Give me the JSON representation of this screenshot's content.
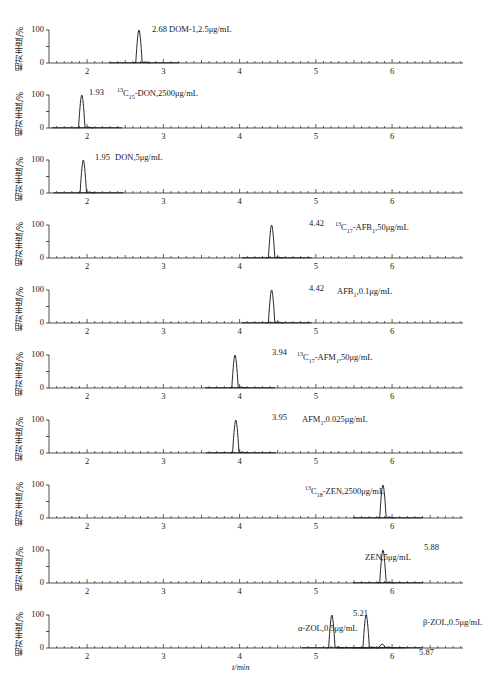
{
  "chart_data": {
    "type": "line",
    "title": "",
    "xlabel": "t/min",
    "ylabel": "相对丰度/%",
    "xlim": [
      1.5,
      6.9
    ],
    "ylim": [
      0,
      100
    ],
    "xticks": [
      "2",
      "3",
      "4",
      "5",
      "6"
    ],
    "yticks": [
      "0",
      "100"
    ],
    "panels": [
      {
        "label": "DOM-1,2.5μg/mL",
        "peaks": [
          {
            "rt": 2.68,
            "label": "2.68",
            "height": 100
          }
        ]
      },
      {
        "label": "13C15-DON,2500μg/mL",
        "peaks": [
          {
            "rt": 1.93,
            "label": "1.93",
            "height": 100
          }
        ]
      },
      {
        "label": "DON,5μg/mL",
        "peaks": [
          {
            "rt": 1.95,
            "label": "1.95",
            "height": 100
          }
        ]
      },
      {
        "label": "13C17-AFB1,50μg/mL",
        "peaks": [
          {
            "rt": 4.42,
            "label": "4.42",
            "height": 100
          }
        ]
      },
      {
        "label": "AFB1,0.1μg/mL",
        "peaks": [
          {
            "rt": 4.42,
            "label": "4.42",
            "height": 100
          }
        ]
      },
      {
        "label": "13C17-AFM1,50μg/mL",
        "peaks": [
          {
            "rt": 3.94,
            "label": "3.94",
            "height": 100
          }
        ]
      },
      {
        "label": "AFM1,0.025μg/mL",
        "peaks": [
          {
            "rt": 3.95,
            "label": "3.95",
            "height": 100
          }
        ]
      },
      {
        "label": "13C18-ZEN,2500μg/mL",
        "peaks": [
          {
            "rt": 5.88,
            "label": "",
            "height": 100
          }
        ]
      },
      {
        "label": "ZEN,5μg/mL",
        "peaks": [
          {
            "rt": 5.88,
            "label": "5.88",
            "height": 100
          }
        ]
      },
      {
        "label": "α-ZOL,0.5μg/mL; β-ZOL,0.5μg/mL",
        "peaks": [
          {
            "rt": 5.21,
            "label": "5.21",
            "height": 100
          },
          {
            "rt": 5.66,
            "label": "",
            "height": 100
          },
          {
            "rt": 5.87,
            "label": "5.87",
            "height": 12
          }
        ]
      }
    ]
  },
  "axis": {
    "ylabel": "相对丰度/%",
    "xlabel": "t/min",
    "y_top": "100",
    "y_bottom": "0",
    "xticks": [
      "2",
      "3",
      "4",
      "5",
      "6"
    ]
  },
  "panels": [
    {
      "rt": "2.68",
      "text": "DOM-1,2.5μg/mL"
    },
    {
      "rt": "1.93",
      "sup": "13",
      "c": "C",
      "sub": "15",
      "rest": "-DON,2500μg/mL"
    },
    {
      "rt": "1.95",
      "text": "DON,5μg/mL"
    },
    {
      "rt": "4.42",
      "sup": "13",
      "c": "C",
      "sub": "17",
      "rest": "-AFB",
      "sub2": "1",
      "rest2": ",50μg/mL"
    },
    {
      "rt": "4.42",
      "pre": "AFB",
      "sub": "1",
      "rest": ",0.1μg/mL"
    },
    {
      "rt": "3.94",
      "sup": "13",
      "c": "C",
      "sub": "17",
      "rest": "-AFM",
      "sub2": "1",
      "rest2": ",50μg/mL"
    },
    {
      "rt": "3.95",
      "pre": "AFM",
      "sub": "1",
      "rest": ",0.025μg/mL"
    },
    {
      "rt": "",
      "sup": "13",
      "c": "C",
      "sub": "18",
      "rest": "-ZEN,2500μg/mL"
    },
    {
      "rt": "5.88",
      "text": "ZEN,5μg/mL"
    },
    {
      "rt": "5.21",
      "rt2": "5.87",
      "text": "α-ZOL,0.5μg/mL",
      "text2": "β-ZOL,0.5μg/mL"
    }
  ]
}
